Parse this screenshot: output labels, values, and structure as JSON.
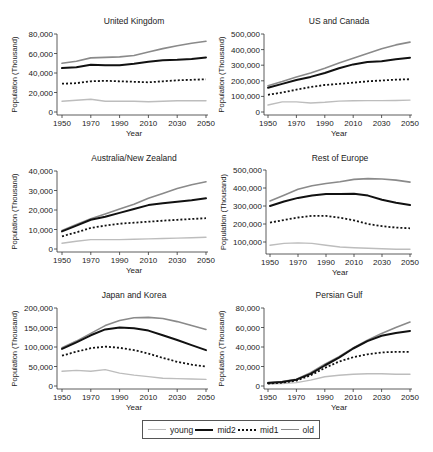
{
  "figure": {
    "legend": {
      "entries": [
        {
          "key": "young",
          "label": "young",
          "color": "#bdbdbd",
          "width": 1.4,
          "dash": ""
        },
        {
          "key": "mid2",
          "label": "mid2",
          "color": "#111111",
          "width": 2.0,
          "dash": ""
        },
        {
          "key": "mid1",
          "label": "mid1",
          "color": "#111111",
          "width": 1.8,
          "dash": "2,2"
        },
        {
          "key": "old",
          "label": "old",
          "color": "#8a8a8a",
          "width": 1.6,
          "dash": ""
        }
      ]
    }
  },
  "chart_data": [
    {
      "type": "line",
      "title": "United Kingdom",
      "xlabel": "Year",
      "ylabel": "Population (Thousand)",
      "x": [
        1950,
        1960,
        1970,
        1980,
        1990,
        2000,
        2010,
        2020,
        2030,
        2040,
        2050
      ],
      "xticks": [
        1950,
        1970,
        1990,
        2010,
        2030,
        2050
      ],
      "yticks": [
        0,
        20000,
        40000,
        60000,
        80000
      ],
      "yticklabels": [
        "0",
        "20,000",
        "40,000",
        "60,000",
        "80,000"
      ],
      "ylim": [
        0,
        80000
      ],
      "series": [
        {
          "name": "young",
          "values": [
            11000,
            12000,
            13000,
            11000,
            11000,
            11000,
            10500,
            11000,
            11500,
            11500,
            11500
          ]
        },
        {
          "name": "mid2",
          "values": [
            45000,
            46000,
            48500,
            48000,
            48000,
            49500,
            51500,
            53000,
            53500,
            54500,
            56000
          ]
        },
        {
          "name": "mid1",
          "values": [
            29000,
            29500,
            31500,
            32000,
            31500,
            31000,
            30500,
            31500,
            32500,
            33000,
            33500
          ]
        },
        {
          "name": "old",
          "values": [
            50000,
            52000,
            55500,
            56000,
            56500,
            58000,
            61500,
            65000,
            68000,
            70500,
            72500
          ]
        }
      ]
    },
    {
      "type": "line",
      "title": "US and Canada",
      "xlabel": "Year",
      "ylabel": "Population (Thousand)",
      "x": [
        1950,
        1960,
        1970,
        1980,
        1990,
        2000,
        2010,
        2020,
        2030,
        2040,
        2050
      ],
      "xticks": [
        1950,
        1970,
        1990,
        2010,
        2030,
        2050
      ],
      "yticks": [
        0,
        100000,
        200000,
        300000,
        400000,
        500000
      ],
      "yticklabels": [
        "0",
        "100,000",
        "200,000",
        "300,000",
        "400,000",
        "500,000"
      ],
      "ylim": [
        0,
        500000
      ],
      "series": [
        {
          "name": "young",
          "values": [
            45000,
            65000,
            65000,
            58000,
            62000,
            70000,
            72000,
            73000,
            73000,
            74000,
            76000
          ]
        },
        {
          "name": "mid2",
          "values": [
            155000,
            180000,
            205000,
            225000,
            250000,
            280000,
            305000,
            320000,
            325000,
            338000,
            348000
          ]
        },
        {
          "name": "mid1",
          "values": [
            110000,
            125000,
            143000,
            160000,
            173000,
            180000,
            188000,
            197000,
            202000,
            207000,
            210000
          ]
        },
        {
          "name": "old",
          "values": [
            168000,
            195000,
            225000,
            250000,
            280000,
            315000,
            345000,
            375000,
            405000,
            430000,
            448000
          ]
        }
      ]
    },
    {
      "type": "line",
      "title": "Australia/New Zealand",
      "xlabel": "Year",
      "ylabel": "Population (Thousand)",
      "x": [
        1950,
        1960,
        1970,
        1980,
        1990,
        2000,
        2010,
        2020,
        2030,
        2040,
        2050
      ],
      "xticks": [
        1950,
        1970,
        1990,
        2010,
        2030,
        2050
      ],
      "yticks": [
        0,
        10000,
        20000,
        30000,
        40000
      ],
      "yticklabels": [
        "0",
        "10,000",
        "20,000",
        "30,000",
        "40,000"
      ],
      "ylim": [
        0,
        40000
      ],
      "series": [
        {
          "name": "young",
          "values": [
            3000,
            4000,
            4800,
            4800,
            4800,
            5000,
            5200,
            5400,
            5600,
            5800,
            6000
          ]
        },
        {
          "name": "mid2",
          "values": [
            9000,
            12000,
            15000,
            16500,
            18500,
            20500,
            22500,
            23500,
            24200,
            25000,
            26000
          ]
        },
        {
          "name": "mid1",
          "values": [
            6500,
            8500,
            10800,
            12000,
            13000,
            13500,
            14000,
            14500,
            15000,
            15400,
            15800
          ]
        },
        {
          "name": "old",
          "values": [
            9500,
            12500,
            15500,
            18000,
            20500,
            23000,
            26000,
            28500,
            31000,
            33000,
            34500
          ]
        }
      ]
    },
    {
      "type": "line",
      "title": "Rest of Europe",
      "xlabel": "Year",
      "ylabel": "Population (Thousand)",
      "x": [
        1950,
        1960,
        1970,
        1980,
        1990,
        2000,
        2010,
        2020,
        2030,
        2040,
        2050
      ],
      "xticks": [
        1950,
        1970,
        1990,
        2010,
        2030,
        2050
      ],
      "yticks": [
        100000,
        200000,
        300000,
        400000,
        500000
      ],
      "yticklabels": [
        "100,000",
        "200,000",
        "300,000",
        "400,000",
        "500,000"
      ],
      "ylim": [
        50000,
        500000
      ],
      "series": [
        {
          "name": "young",
          "values": [
            82000,
            92000,
            95000,
            92000,
            82000,
            72000,
            68000,
            65000,
            62000,
            60000,
            60000
          ]
        },
        {
          "name": "mid2",
          "values": [
            300000,
            325000,
            345000,
            358000,
            367000,
            367000,
            368000,
            358000,
            335000,
            318000,
            305000
          ]
        },
        {
          "name": "mid1",
          "values": [
            208000,
            222000,
            236000,
            245000,
            245000,
            235000,
            220000,
            200000,
            188000,
            180000,
            176000
          ]
        },
        {
          "name": "old",
          "values": [
            328000,
            360000,
            393000,
            412000,
            425000,
            435000,
            448000,
            452000,
            450000,
            444000,
            433000
          ]
        }
      ]
    },
    {
      "type": "line",
      "title": "Japan and Korea",
      "xlabel": "Year",
      "ylabel": "Population (Thousand)",
      "x": [
        1950,
        1960,
        1970,
        1980,
        1990,
        2000,
        2010,
        2020,
        2030,
        2040,
        2050
      ],
      "xticks": [
        1950,
        1970,
        1990,
        2010,
        2030,
        2050
      ],
      "yticks": [
        0,
        50000,
        100000,
        150000,
        200000
      ],
      "yticklabels": [
        "0",
        "50,000",
        "100,000",
        "150,000",
        "200,000"
      ],
      "ylim": [
        0,
        200000
      ],
      "series": [
        {
          "name": "young",
          "values": [
            38000,
            40000,
            38000,
            42000,
            33000,
            28000,
            24000,
            20000,
            19000,
            18000,
            17000
          ]
        },
        {
          "name": "mid2",
          "values": [
            95000,
            112000,
            130000,
            145000,
            150000,
            148000,
            142000,
            130000,
            118000,
            105000,
            92000
          ]
        },
        {
          "name": "mid1",
          "values": [
            78000,
            88000,
            97000,
            101000,
            98000,
            92000,
            83000,
            72000,
            62000,
            55000,
            50000
          ]
        },
        {
          "name": "old",
          "values": [
            98000,
            115000,
            135000,
            155000,
            168000,
            175000,
            176000,
            173000,
            165000,
            155000,
            145000
          ]
        }
      ]
    },
    {
      "type": "line",
      "title": "Persian Gulf",
      "xlabel": "Year",
      "ylabel": "Population (Thousand)",
      "x": [
        1950,
        1960,
        1970,
        1980,
        1990,
        2000,
        2010,
        2020,
        2030,
        2040,
        2050
      ],
      "xticks": [
        1950,
        1970,
        1990,
        2010,
        2030,
        2050
      ],
      "yticks": [
        0,
        20000,
        40000,
        60000,
        80000
      ],
      "yticklabels": [
        "0",
        "20,000",
        "40,000",
        "60,000",
        "80,000"
      ],
      "ylim": [
        0,
        80000
      ],
      "series": [
        {
          "name": "young",
          "values": [
            2000,
            2500,
            3500,
            6000,
            9500,
            11000,
            12000,
            12500,
            12500,
            12000,
            12000
          ]
        },
        {
          "name": "mid2",
          "values": [
            3000,
            4000,
            6500,
            12500,
            21000,
            29000,
            38500,
            46000,
            51500,
            54500,
            56500
          ]
        },
        {
          "name": "mid1",
          "values": [
            2500,
            3500,
            5500,
            11000,
            18500,
            25000,
            29500,
            32500,
            34500,
            35000,
            35000
          ]
        },
        {
          "name": "old",
          "values": [
            3500,
            4500,
            7000,
            13500,
            22500,
            30000,
            39000,
            47000,
            54000,
            60000,
            65500
          ]
        }
      ]
    }
  ]
}
